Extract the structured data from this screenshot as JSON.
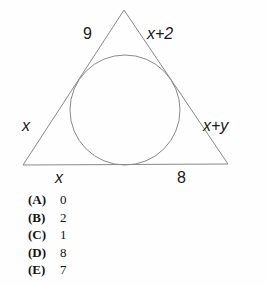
{
  "figure": {
    "stroke_color": "#8a8a8a",
    "background_color": "#fefeff",
    "triangle": {
      "apex": [
        124,
        10
      ],
      "bottom_left": [
        23,
        165
      ],
      "bottom_right": [
        228,
        164
      ]
    },
    "circle": {
      "center": [
        125,
        110
      ],
      "radius": 55
    },
    "labels": {
      "upper_left": "9",
      "upper_right": "x+2",
      "left": "x",
      "right": "x+y",
      "bottom_left": "x",
      "bottom_right": "8"
    }
  },
  "choices": [
    {
      "letter": "(A)",
      "value": "0"
    },
    {
      "letter": "(B)",
      "value": "2"
    },
    {
      "letter": "(C)",
      "value": "1"
    },
    {
      "letter": "(D)",
      "value": "8"
    },
    {
      "letter": "(E)",
      "value": "7"
    }
  ]
}
